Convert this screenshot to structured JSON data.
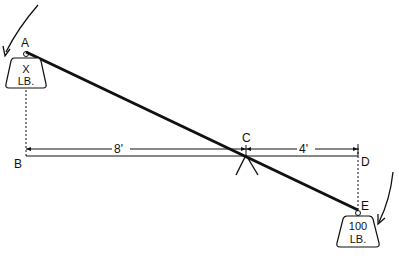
{
  "diagram": {
    "points": {
      "A": "A",
      "B": "B",
      "C": "C",
      "D": "D",
      "E": "E"
    },
    "dimensions": {
      "left_span": "8'",
      "right_span": "4'"
    },
    "weights": {
      "left": {
        "line1": "X",
        "line2": "LB."
      },
      "right": {
        "line1": "100",
        "line2": "LB."
      }
    },
    "colors": {
      "ink": "#111111",
      "background": "#ffffff"
    }
  }
}
